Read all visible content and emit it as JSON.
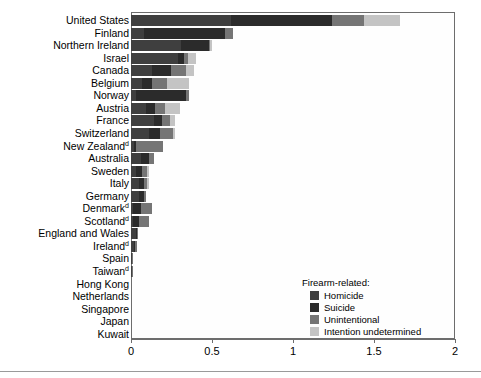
{
  "chart_data": {
    "type": "bar",
    "orientation": "horizontal",
    "stacked": true,
    "title": "",
    "xlabel": "",
    "ylabel": "",
    "xlim": [
      0,
      2
    ],
    "xticks": [
      0,
      0.5,
      1,
      1.5,
      2
    ],
    "xtick_labels": [
      "0",
      "0.5",
      "1",
      "1.5",
      "2"
    ],
    "grid": false,
    "legend_title": "Firearm-related:",
    "legend_position": "inside-lower-right",
    "series": [
      {
        "name": "Homicide",
        "color": "#3f3f3f",
        "values": [
          0.62,
          0.08,
          0.31,
          0.29,
          0.13,
          0.07,
          0.03,
          0.09,
          0.14,
          0.11,
          0.02,
          0.06,
          0.03,
          0.05,
          0.05,
          0.01,
          0.01,
          0.03,
          0.02,
          0.008,
          0.007,
          0,
          0,
          0,
          0,
          0
        ]
      },
      {
        "name": "Suicide",
        "color": "#2b2b2b",
        "values": [
          0.62,
          0.5,
          0.17,
          0.04,
          0.12,
          0.06,
          0.31,
          0.06,
          0.05,
          0.07,
          0.01,
          0.05,
          0.04,
          0.03,
          0.03,
          0.05,
          0.04,
          0.005,
          0.006,
          0,
          0,
          0,
          0,
          0,
          0,
          0
        ]
      },
      {
        "name": "Unintentional",
        "color": "#757575",
        "values": [
          0.2,
          0.05,
          0.01,
          0.02,
          0.09,
          0.09,
          0.02,
          0.06,
          0.05,
          0.08,
          0.17,
          0.03,
          0.03,
          0.02,
          0.01,
          0.07,
          0.06,
          0.01,
          0.01,
          0.003,
          0.004,
          0,
          0,
          0,
          0,
          0
        ]
      },
      {
        "name": "Intention undetermined",
        "color": "#c4c4c4",
        "values": [
          0.22,
          0.0,
          0.01,
          0.05,
          0.05,
          0.14,
          0.0,
          0.09,
          0.03,
          0.01,
          0.0,
          0.0,
          0.01,
          0.01,
          0.0,
          0.0,
          0.0,
          0.0,
          0.0,
          0.0,
          0.0,
          0,
          0,
          0,
          0,
          0
        ]
      }
    ],
    "categories": [
      "United States",
      "Finland",
      "Northern Ireland",
      "Israel",
      "Canada",
      "Belgium",
      "Norway",
      "Austria",
      "France",
      "Switzerland",
      "New Zealand",
      "Australia",
      "Sweden",
      "Italy",
      "Germany",
      "Denmark",
      "Scotland",
      "England and Wales",
      "Ireland",
      "Spain",
      "Taiwan",
      "Hong Kong",
      "Netherlands",
      "Singapore",
      "Japan",
      "Kuwait"
    ],
    "category_footnotes": {
      "New Zealand": "d",
      "Denmark": "d",
      "Scotland": "d",
      "Ireland": "d",
      "Taiwan": "d"
    },
    "totals": [
      1.66,
      0.63,
      0.5,
      0.4,
      0.39,
      0.36,
      0.36,
      0.3,
      0.27,
      0.27,
      0.2,
      0.14,
      0.11,
      0.11,
      0.09,
      0.13,
      0.11,
      0.045,
      0.036,
      0.011,
      0.011,
      0.0,
      0.0,
      0.0,
      0.0,
      0.0
    ]
  },
  "legend": {
    "title": "Firearm-related:",
    "items": [
      {
        "label": "Homicide",
        "color": "#3f3f3f"
      },
      {
        "label": "Suicide",
        "color": "#2b2b2b"
      },
      {
        "label": "Unintentional",
        "color": "#757575"
      },
      {
        "label": "Intention undetermined",
        "color": "#c4c4c4"
      }
    ]
  },
  "axis": {
    "ticks": [
      {
        "value": 0,
        "label": "0"
      },
      {
        "value": 0.5,
        "label": "0.5"
      },
      {
        "value": 1,
        "label": "1"
      },
      {
        "value": 1.5,
        "label": "1.5"
      },
      {
        "value": 2,
        "label": "2"
      }
    ]
  }
}
